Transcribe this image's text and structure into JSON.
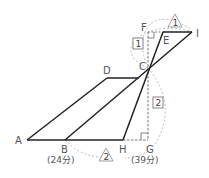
{
  "diagram": {
    "points": {
      "A": "A",
      "B": "B",
      "C": "C",
      "D": "D",
      "E": "E",
      "F": "F",
      "G": "G",
      "H": "H",
      "I": "I"
    },
    "times": {
      "B": "(24分)",
      "G": "(39分)"
    },
    "box_labels": {
      "upper": "1",
      "lower": "2"
    },
    "triangle_labels": {
      "upper": "1",
      "lower": "2"
    },
    "colors": {
      "line": "#222222",
      "dashed": "#666666",
      "arc": "#aaaaaa",
      "text": "#555555"
    }
  }
}
